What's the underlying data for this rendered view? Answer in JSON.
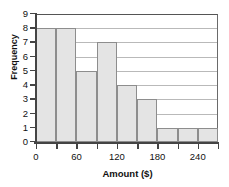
{
  "chart_data": {
    "type": "bar",
    "title": "",
    "xlabel": "Amount ($)",
    "ylabel": "Frequency",
    "bin_width": 30,
    "bin_edges": [
      0,
      30,
      60,
      90,
      120,
      150,
      180,
      210,
      240,
      270
    ],
    "categories": [
      "0-30",
      "30-60",
      "60-90",
      "90-120",
      "120-150",
      "150-180",
      "180-210",
      "210-240",
      "240-270"
    ],
    "values": [
      8,
      8,
      5,
      7,
      4,
      3,
      1,
      1,
      1
    ],
    "xlim": [
      0,
      270
    ],
    "ylim": [
      0,
      9
    ],
    "x_ticks": [
      0,
      30,
      60,
      90,
      120,
      150,
      180,
      210,
      240,
      270
    ],
    "x_tick_labels": [
      "0",
      "",
      "60",
      "",
      "120",
      "",
      "180",
      "",
      "240",
      ""
    ],
    "y_ticks": [
      0,
      1,
      2,
      3,
      4,
      5,
      6,
      7,
      8,
      9
    ],
    "y_tick_labels": [
      "0",
      "1",
      "2",
      "3",
      "4",
      "5",
      "6",
      "7",
      "8",
      "9"
    ],
    "grid": true,
    "grid_axis": "y",
    "legend": null,
    "bar_fill_color": "#e4e4e4",
    "bar_edge_color": "#8d8d8d",
    "gridline_color": "#b9b9b9",
    "axis_color": "#444444"
  }
}
